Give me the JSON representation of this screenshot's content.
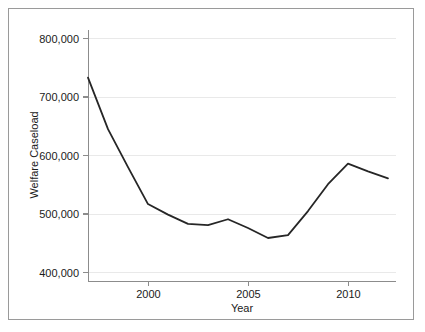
{
  "chart_data": {
    "type": "line",
    "title": "",
    "xlabel": "Year",
    "ylabel": "Welfare Caseload",
    "xlim": [
      1997,
      2012
    ],
    "ylim": [
      390000,
      815000
    ],
    "grid": true,
    "legend": "none",
    "x_tick_labels": [
      "2000",
      "2005",
      "2010"
    ],
    "x_ticks": [
      2000,
      2005,
      2010
    ],
    "y_tick_labels": [
      "400,000",
      "500,000",
      "600,000",
      "700,000",
      "800,000"
    ],
    "y_ticks": [
      400000,
      500000,
      600000,
      700000,
      800000
    ],
    "x": [
      1997,
      1998,
      1999,
      2000,
      2001,
      2002,
      2003,
      2004,
      2005,
      2006,
      2007,
      2008,
      2009,
      2010,
      2011,
      2012
    ],
    "series": [
      {
        "name": "Welfare Caseload",
        "color": "#262626",
        "values": [
          733000,
          645000,
          580000,
          517000,
          499000,
          483000,
          481000,
          491000,
          476000,
          459000,
          464000,
          505000,
          551000,
          586000,
          573000,
          561000
        ]
      }
    ]
  },
  "axes": {
    "x_title": "Year",
    "y_title": "Welfare Caseload"
  },
  "colors": {
    "line": "#262626",
    "grid": "#e9e9e9",
    "axis": "#8c8c8c",
    "frame": "#9a9a9a",
    "background": "#ffffff",
    "text": "#1b1b1b"
  }
}
